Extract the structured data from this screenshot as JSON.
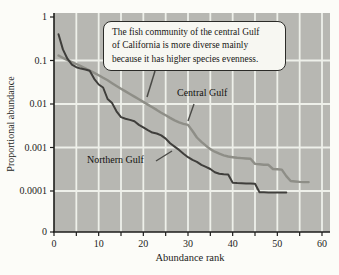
{
  "figure": {
    "background": "#fcfcf8",
    "plot_bg": "#b7b7b2",
    "grid_color": "#eef0ea",
    "axis_color": "#1d1d1b",
    "pointer_color": "#4a4a46"
  },
  "annotation": {
    "lines": [
      "The fish community of the central Gulf",
      "of California is more diverse mainly",
      "because it has higher species evenness."
    ]
  },
  "chart_data": {
    "type": "line",
    "title": "",
    "xlabel": "Abundance rank",
    "ylabel": "Proportional abundance",
    "xlim": [
      0,
      60
    ],
    "x_tick_labels": [
      "0",
      "10",
      "20",
      "30",
      "40",
      "50",
      "60"
    ],
    "x_minor_tick_step": 5,
    "y_scale": "log",
    "ylim_log_decades": [
      1,
      0.0001
    ],
    "y_tick_labels": [
      "1",
      "0.1",
      "0.01",
      "0.001",
      "0.0001",
      "0"
    ],
    "grid": true,
    "x_rule": "abundance rank = array index + 1",
    "series": [
      {
        "id": "central-gulf",
        "name": "Central Gulf",
        "color": "#8e8e87",
        "width": 2.4,
        "values": [
          0.13,
          0.115,
          0.102,
          0.092,
          0.083,
          0.074,
          0.066,
          0.059,
          0.052,
          0.046,
          0.04,
          0.035,
          0.03,
          0.026,
          0.0225,
          0.0195,
          0.017,
          0.0148,
          0.0128,
          0.0112,
          0.0097,
          0.0084,
          0.0073,
          0.0063,
          0.0055,
          0.0048,
          0.0042,
          0.0038,
          0.0035,
          0.0033,
          0.0024,
          0.0017,
          0.00135,
          0.0011,
          0.00092,
          0.0008,
          0.00072,
          0.00066,
          0.00062,
          0.0006,
          0.00058,
          0.00057,
          0.00056,
          0.00055,
          0.00042,
          0.00041,
          0.0004,
          0.0004,
          0.00032,
          0.000315,
          0.00031,
          0.00022,
          0.00017,
          0.000165,
          0.000162,
          0.00016,
          0.00016
        ]
      },
      {
        "id": "northern-gulf",
        "name": "Northern Gulf",
        "color": "#3f3e3b",
        "width": 2.0,
        "values": [
          0.4,
          0.18,
          0.11,
          0.08,
          0.07,
          0.065,
          0.062,
          0.058,
          0.038,
          0.028,
          0.024,
          0.013,
          0.0105,
          0.0068,
          0.005,
          0.0046,
          0.0043,
          0.004,
          0.0033,
          0.0029,
          0.0025,
          0.0022,
          0.0021,
          0.0019,
          0.0016,
          0.00125,
          0.00105,
          0.00088,
          0.00072,
          0.0006,
          0.00052,
          0.00047,
          0.0004,
          0.00036,
          0.00032,
          0.00027,
          0.00025,
          0.000242,
          0.000238,
          0.000155,
          0.000152,
          0.00015,
          0.000149,
          0.000148,
          0.000147,
          9.4e-05,
          9.35e-05,
          9.3e-05,
          9.25e-05,
          9.25e-05,
          9.25e-05,
          9.25e-05
        ]
      }
    ]
  }
}
